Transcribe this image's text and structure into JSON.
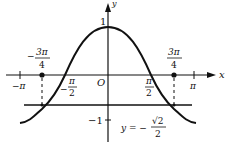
{
  "figure": {
    "colors": {
      "ink": "#111111",
      "background": "#ffffff"
    },
    "axes": {
      "x_label": "x",
      "y_label": "y",
      "origin_label": "O",
      "y_tick_pos_label": "1",
      "y_tick_neg_label": "−1"
    },
    "x_ticks": {
      "neg_pi": "−π",
      "pi": "π",
      "neg_half_pi_minus": "−",
      "half_pi_num": "π",
      "half_pi_den": "2",
      "three_quarter_num": "3π",
      "three_quarter_den": "4",
      "neg_sign": "−"
    },
    "line": {
      "label_prefix": "y = −",
      "label_num": "√2",
      "label_den": "2"
    },
    "points": [
      {
        "x": "−3π/4",
        "y": "−√2/2"
      },
      {
        "x": "3π/4",
        "y": "−√2/2"
      }
    ]
  }
}
